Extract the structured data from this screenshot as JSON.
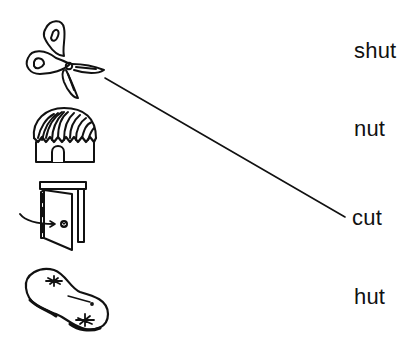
{
  "worksheet": {
    "title": "",
    "pictures": [
      {
        "id": "scissors",
        "icon": "scissors-icon"
      },
      {
        "id": "hut",
        "icon": "hut-icon"
      },
      {
        "id": "door",
        "icon": "door-icon"
      },
      {
        "id": "peanut",
        "icon": "peanut-icon"
      }
    ],
    "words": [
      {
        "text": "shut"
      },
      {
        "text": "nut"
      },
      {
        "text": "cut"
      },
      {
        "text": "hut"
      }
    ],
    "matches": [
      {
        "from": "scissors",
        "to": "cut",
        "x1": 105,
        "y1": 78,
        "x2": 345,
        "y2": 217
      }
    ],
    "colors": {
      "ink": "#111111",
      "background": "#ffffff"
    }
  }
}
